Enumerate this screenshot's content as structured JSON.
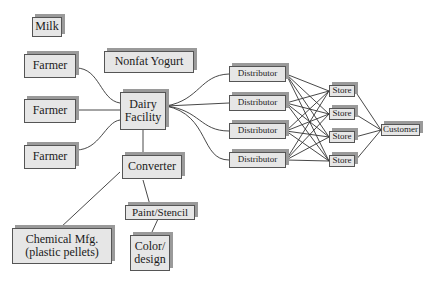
{
  "nodes": {
    "milk": "Milk",
    "farmer1": "Farmer",
    "farmer2": "Farmer",
    "farmer3": "Farmer",
    "nonfat_yogurt": "Nonfat Yogurt",
    "dairy_facility": "Dairy\nFacility",
    "converter": "Converter",
    "chemical_mfg": "Chemical Mfg.\n(plastic pellets)",
    "paint_stencil": "Paint/Stencil",
    "color_design": "Color/\ndesign",
    "distributor1": "Distributor",
    "distributor2": "Distributor",
    "distributor3": "Distributor",
    "distributor4": "Distributor",
    "store1": "Store",
    "store2": "Store",
    "store3": "Store",
    "store4": "Store",
    "customer": "Customer"
  }
}
